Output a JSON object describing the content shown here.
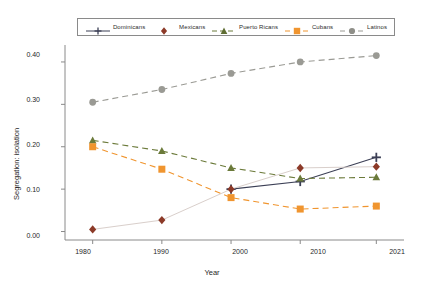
{
  "chart_data": {
    "type": "line",
    "title": "",
    "xlabel": "Year",
    "ylabel": "Segregation: isolation",
    "x": [
      1980,
      1990,
      2000,
      2010,
      2021
    ],
    "xtick_labels": [
      "1980",
      "1990",
      "2000",
      "2010",
      "2021"
    ],
    "ytick_labels": [
      "0.00",
      "0.10",
      "0.20",
      "0.30",
      "0.40"
    ],
    "ytick_values": [
      0.0,
      0.1,
      0.2,
      0.3,
      0.4
    ],
    "xlim": [
      1976,
      2025
    ],
    "ylim": [
      -0.02,
      0.44
    ],
    "grid": false,
    "legend_position": "top-center",
    "series": [
      {
        "name": "Dominicans",
        "color": "#3b3f55",
        "marker": "plus",
        "linestyle": "solid",
        "x": [
          2000,
          2010,
          2021
        ],
        "values": [
          0.1,
          0.118,
          0.175
        ]
      },
      {
        "name": "Mexicans",
        "color": "#8c3a28",
        "marker": "diamond",
        "linestyle": "solid-faint",
        "x": [
          1980,
          1990,
          2000,
          2010,
          2021
        ],
        "values": [
          0.005,
          0.027,
          0.1,
          0.15,
          0.153
        ]
      },
      {
        "name": "Puerto Ricans",
        "color": "#6b7a3a",
        "marker": "triangle",
        "linestyle": "dashed",
        "x": [
          1980,
          1990,
          2000,
          2010,
          2021
        ],
        "values": [
          0.215,
          0.19,
          0.15,
          0.125,
          0.128
        ]
      },
      {
        "name": "Cubans",
        "color": "#f0952f",
        "marker": "square",
        "linestyle": "dashed",
        "x": [
          1980,
          1990,
          2000,
          2010,
          2021
        ],
        "values": [
          0.2,
          0.147,
          0.08,
          0.053,
          0.06
        ]
      },
      {
        "name": "Latinos",
        "color": "#9a9a94",
        "marker": "circle",
        "linestyle": "dashed",
        "x": [
          1980,
          1990,
          2000,
          2010,
          2021
        ],
        "values": [
          0.305,
          0.335,
          0.373,
          0.4,
          0.415
        ]
      }
    ]
  },
  "legend": {
    "entries": [
      {
        "label": "Dominicans"
      },
      {
        "label": "Mexicans"
      },
      {
        "label": "Puerto Ricans"
      },
      {
        "label": "Cubans"
      },
      {
        "label": "Latinos"
      }
    ]
  },
  "axes": {
    "y_title": "Segregation: isolation",
    "x_title": "Year",
    "y_ticks": [
      "0.40",
      "0.30",
      "0.20",
      "0.10",
      "0.00"
    ],
    "x_ticks": [
      "1980",
      "1990",
      "2000",
      "2010",
      "2021"
    ]
  }
}
